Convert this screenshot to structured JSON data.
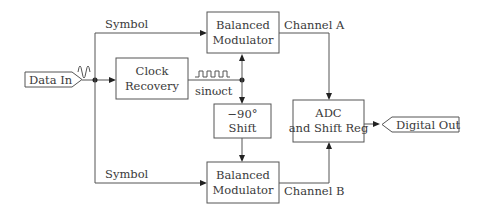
{
  "diagram": {
    "input": {
      "label": "Data In"
    },
    "output": {
      "label": "Digital Out"
    },
    "blocks": {
      "clock_recovery": {
        "line1": "Clock",
        "line2": "Recovery"
      },
      "modulator_a": {
        "line1": "Balanced",
        "line2": "Modulator"
      },
      "modulator_b": {
        "line1": "Balanced",
        "line2": "Modulator"
      },
      "phase_shift": {
        "line1": "−90°",
        "line2": "Shift"
      },
      "adc": {
        "line1": "ADC",
        "line2": "and Shift Reg"
      }
    },
    "labels": {
      "symbol_top": "Symbol",
      "symbol_bottom": "Symbol",
      "channel_a": "Channel A",
      "channel_b": "Channel B",
      "carrier": "sinωct"
    },
    "colors": {
      "stroke": "#555555",
      "text": "#3a3a3a"
    }
  }
}
